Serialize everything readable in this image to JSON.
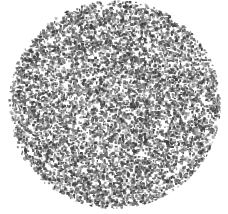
{
  "image": {
    "title": "Speckled Circular Disc",
    "description": "Dense random dark-gray speckle noise confined to a circular disc on a white background",
    "width": 228,
    "height": 214,
    "background_color": "#ffffff"
  },
  "disc": {
    "name": "speckle-disc",
    "center_x": 114,
    "center_y": 104,
    "radius_x": 107,
    "radius_y": 105,
    "fill_color": "#ffffff",
    "edge_softness": 3
  },
  "speckle": {
    "name": "speckle-texture",
    "pattern": "random-grain",
    "count": 9000,
    "min_size": 1,
    "max_size": 3,
    "color_dark": "#3f3f3f",
    "color_mid": "#6e6e6e",
    "color_light": "#a8a8a8",
    "density": 0.22,
    "seed": 20240517
  }
}
